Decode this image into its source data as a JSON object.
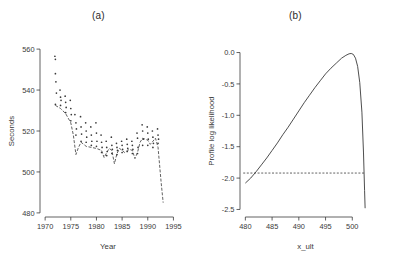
{
  "figure": {
    "background": "#ffffff",
    "ink_color": "#3a3a3a",
    "panels": [
      {
        "id": "a",
        "title": "(a)"
      },
      {
        "id": "b",
        "title": "(b)"
      }
    ]
  },
  "chart_data": [
    {
      "type": "scatter",
      "panel": "(a)",
      "title": "(a)",
      "xlabel": "Year",
      "ylabel": "Seconds",
      "xlim": [
        1969.0,
        1995.5
      ],
      "ylim": [
        478.0,
        562.0
      ],
      "xticks": [
        1970,
        1975,
        1980,
        1985,
        1990,
        1995
      ],
      "yticks": [
        480,
        500,
        520,
        540,
        560
      ],
      "xtick_labels": [
        "1970",
        "1975",
        "1980",
        "1985",
        "1990",
        "1995"
      ],
      "ytick_labels": [
        "480",
        "500",
        "520",
        "540",
        "560"
      ],
      "grid": false,
      "legend": false,
      "series": [
        {
          "name": "observed times",
          "marker": "point",
          "points": [
            [
              1971.9,
              556.5
            ],
            [
              1972.0,
              555.0
            ],
            [
              1972.0,
              548.0
            ],
            [
              1972.1,
              544.0
            ],
            [
              1972.2,
              538.5
            ],
            [
              1972.0,
              533.0
            ],
            [
              1972.9,
              540.0
            ],
            [
              1973.0,
              536.5
            ],
            [
              1973.1,
              535.0
            ],
            [
              1973.0,
              532.5
            ],
            [
              1973.9,
              537.0
            ],
            [
              1974.0,
              534.0
            ],
            [
              1974.1,
              531.5
            ],
            [
              1974.0,
              529.0
            ],
            [
              1974.9,
              535.0
            ],
            [
              1975.0,
              531.0
            ],
            [
              1975.1,
              528.0
            ],
            [
              1975.0,
              525.0
            ],
            [
              1975.8,
              528.0
            ],
            [
              1976.0,
              524.0
            ],
            [
              1976.1,
              521.0
            ],
            [
              1976.0,
              518.0
            ],
            [
              1976.9,
              527.0
            ],
            [
              1977.0,
              522.0
            ],
            [
              1977.1,
              518.5
            ],
            [
              1977.0,
              515.0
            ],
            [
              1977.9,
              524.0
            ],
            [
              1978.0,
              520.0
            ],
            [
              1978.1,
              517.0
            ],
            [
              1978.0,
              514.5
            ],
            [
              1978.9,
              522.0
            ],
            [
              1979.0,
              518.0
            ],
            [
              1979.1,
              515.0
            ],
            [
              1979.0,
              513.0
            ],
            [
              1979.9,
              524.0
            ],
            [
              1980.0,
              519.0
            ],
            [
              1980.1,
              515.0
            ],
            [
              1980.0,
              512.5
            ],
            [
              1980.9,
              518.0
            ],
            [
              1981.0,
              514.5
            ],
            [
              1981.1,
              512.0
            ],
            [
              1981.0,
              509.5
            ],
            [
              1981.9,
              515.0
            ],
            [
              1982.0,
              512.0
            ],
            [
              1982.1,
              510.0
            ],
            [
              1982.0,
              508.0
            ],
            [
              1982.9,
              517.0
            ],
            [
              1983.0,
              513.0
            ],
            [
              1983.1,
              511.0
            ],
            [
              1983.0,
              509.0
            ],
            [
              1983.9,
              514.0
            ],
            [
              1984.0,
              512.0
            ],
            [
              1984.1,
              510.5
            ],
            [
              1984.0,
              508.5
            ],
            [
              1984.9,
              515.0
            ],
            [
              1985.0,
              513.0
            ],
            [
              1985.1,
              511.0
            ],
            [
              1985.0,
              509.5
            ],
            [
              1985.9,
              516.0
            ],
            [
              1986.0,
              513.5
            ],
            [
              1986.1,
              511.5
            ],
            [
              1986.0,
              510.0
            ],
            [
              1986.9,
              515.0
            ],
            [
              1987.0,
              513.0
            ],
            [
              1987.1,
              511.0
            ],
            [
              1987.0,
              509.0
            ],
            [
              1987.9,
              519.0
            ],
            [
              1988.0,
              516.5
            ],
            [
              1988.1,
              512.0
            ],
            [
              1988.0,
              509.0
            ],
            [
              1988.9,
              523.0
            ],
            [
              1989.0,
              520.0
            ],
            [
              1989.1,
              516.0
            ],
            [
              1989.0,
              513.0
            ],
            [
              1989.9,
              522.0
            ],
            [
              1990.0,
              519.0
            ],
            [
              1990.1,
              516.0
            ],
            [
              1990.0,
              513.0
            ],
            [
              1990.9,
              520.0
            ],
            [
              1991.0,
              517.0
            ],
            [
              1991.1,
              514.0
            ],
            [
              1991.0,
              512.0
            ],
            [
              1991.9,
              521.0
            ],
            [
              1992.0,
              518.0
            ],
            [
              1992.1,
              516.0
            ],
            [
              1992.0,
              514.0
            ]
          ]
        },
        {
          "name": "fitted curve",
          "style": "dashed-line",
          "points": [
            [
              1972.0,
              532.5
            ],
            [
              1973.0,
              531.0
            ],
            [
              1974.0,
              528.5
            ],
            [
              1975.0,
              524.0
            ],
            [
              1975.5,
              518.0
            ],
            [
              1976.0,
              508.5
            ],
            [
              1976.5,
              512.0
            ],
            [
              1977.0,
              514.5
            ],
            [
              1977.5,
              513.5
            ],
            [
              1978.0,
              512.5
            ],
            [
              1979.0,
              512.0
            ],
            [
              1980.0,
              511.5
            ],
            [
              1981.0,
              510.5
            ],
            [
              1981.5,
              507.0
            ],
            [
              1982.0,
              509.5
            ],
            [
              1982.5,
              511.5
            ],
            [
              1983.0,
              510.5
            ],
            [
              1983.5,
              504.0
            ],
            [
              1984.0,
              509.0
            ],
            [
              1984.5,
              511.5
            ],
            [
              1985.0,
              510.5
            ],
            [
              1985.5,
              509.5
            ],
            [
              1986.0,
              510.5
            ],
            [
              1986.5,
              511.0
            ],
            [
              1987.0,
              510.5
            ],
            [
              1987.5,
              506.5
            ],
            [
              1988.0,
              509.5
            ],
            [
              1988.5,
              514.5
            ],
            [
              1989.0,
              516.5
            ],
            [
              1990.0,
              515.5
            ],
            [
              1990.5,
              513.5
            ],
            [
              1991.0,
              515.0
            ],
            [
              1991.5,
              516.5
            ],
            [
              1992.0,
              512.0
            ],
            [
              1992.6,
              495.0
            ],
            [
              1993.0,
              485.0
            ]
          ]
        }
      ]
    },
    {
      "type": "line",
      "panel": "(b)",
      "title": "(b)",
      "xlabel": "x_ult",
      "ylabel": "Profile log likelihood",
      "xlim": [
        479.0,
        503.5
      ],
      "ylim": [
        -2.62,
        0.12
      ],
      "xticks": [
        480,
        485,
        490,
        495,
        500
      ],
      "yticks": [
        0.0,
        -0.5,
        -1.0,
        -1.5,
        -2.0,
        -2.5
      ],
      "xtick_labels": [
        "480",
        "485",
        "490",
        "495",
        "500"
      ],
      "ytick_labels": [
        "0.0",
        "-0.5",
        "-1.0",
        "-1.5",
        "-2.0",
        "-2.5"
      ],
      "grid": false,
      "legend": false,
      "series": [
        {
          "name": "profile log likelihood",
          "style": "solid-line",
          "points": [
            [
              480.0,
              -2.08
            ],
            [
              481.0,
              -2.0
            ],
            [
              482.0,
              -1.9
            ],
            [
              483.0,
              -1.79
            ],
            [
              484.0,
              -1.68
            ],
            [
              485.0,
              -1.56
            ],
            [
              486.0,
              -1.44
            ],
            [
              487.0,
              -1.31
            ],
            [
              488.0,
              -1.19
            ],
            [
              489.0,
              -1.06
            ],
            [
              490.0,
              -0.93
            ],
            [
              491.0,
              -0.8
            ],
            [
              492.0,
              -0.68
            ],
            [
              493.0,
              -0.56
            ],
            [
              494.0,
              -0.45
            ],
            [
              495.0,
              -0.34
            ],
            [
              496.0,
              -0.25
            ],
            [
              497.0,
              -0.17
            ],
            [
              498.0,
              -0.09
            ],
            [
              498.8,
              -0.045
            ],
            [
              499.4,
              -0.02
            ],
            [
              499.8,
              -0.015
            ],
            [
              500.2,
              -0.03
            ],
            [
              500.6,
              -0.09
            ],
            [
              501.0,
              -0.22
            ],
            [
              501.4,
              -0.48
            ],
            [
              501.8,
              -0.95
            ],
            [
              502.1,
              -1.6
            ],
            [
              502.3,
              -2.2
            ],
            [
              502.4,
              -2.48
            ]
          ]
        },
        {
          "name": "confidence threshold",
          "style": "dashed-line",
          "level": -1.92,
          "x_range": [
            479.6,
            502.4
          ]
        }
      ],
      "annotations": [
        {
          "text": "horizontal dashed reference line at -1.92",
          "y": -1.92
        }
      ]
    }
  ]
}
